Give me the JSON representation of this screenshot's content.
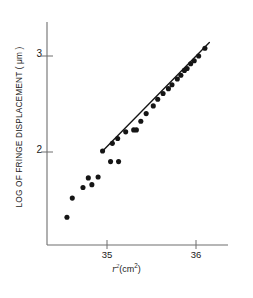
{
  "chart_data": {
    "type": "scatter",
    "title": "",
    "subtitle": "",
    "xlabel_full": "r2(cm2)",
    "xlabel_base": "r",
    "xlabel_exp": "2",
    "xlabel_unit": "(cm",
    "xlabel_unit_exp": "2",
    "xlabel_unit_close": ")",
    "ylabel": "LOG OF FRINGE DISPLACEMENT ( μm )",
    "xlim": [
      34.33,
      36.28
    ],
    "ylim": [
      1.18,
      3.23
    ],
    "xticks": [
      35,
      36
    ],
    "xtick_labels": [
      "35",
      "36"
    ],
    "yticks": [
      2,
      3
    ],
    "ytick_labels": [
      "2",
      "3"
    ],
    "grid": false,
    "legend": null,
    "marker": "filled-circle",
    "marker_color": "#151515",
    "axis_color": "#6f6f6f",
    "series": [
      {
        "name": "scattered-low-region",
        "points": [
          [
            34.55,
            1.32
          ],
          [
            34.61,
            1.52
          ],
          [
            34.73,
            1.63
          ],
          [
            34.79,
            1.73
          ],
          [
            34.83,
            1.66
          ],
          [
            34.9,
            1.74
          ],
          [
            35.04,
            1.9
          ],
          [
            35.13,
            1.9
          ]
        ]
      },
      {
        "name": "linear-region",
        "points": [
          [
            34.95,
            2.01
          ],
          [
            35.06,
            2.09
          ],
          [
            35.12,
            2.14
          ],
          [
            35.21,
            2.21
          ],
          [
            35.3,
            2.23
          ],
          [
            35.33,
            2.23
          ],
          [
            35.38,
            2.32
          ],
          [
            35.44,
            2.4
          ],
          [
            35.52,
            2.48
          ],
          [
            35.57,
            2.55
          ],
          [
            35.63,
            2.61
          ],
          [
            35.69,
            2.66
          ],
          [
            35.73,
            2.7
          ],
          [
            35.79,
            2.76
          ],
          [
            35.83,
            2.8
          ],
          [
            35.87,
            2.85
          ],
          [
            35.9,
            2.87
          ],
          [
            35.94,
            2.92
          ],
          [
            35.98,
            2.95
          ],
          [
            36.03,
            3.0
          ],
          [
            36.1,
            3.08
          ]
        ]
      }
    ],
    "fit_line": {
      "name": "least-squares-fit",
      "x_start": 34.94,
      "y_start": 2.0,
      "x_end": 36.15,
      "y_end": 3.14,
      "slope": 0.942,
      "color": "#151515"
    }
  },
  "footer": {
    "cropped_text": ""
  }
}
